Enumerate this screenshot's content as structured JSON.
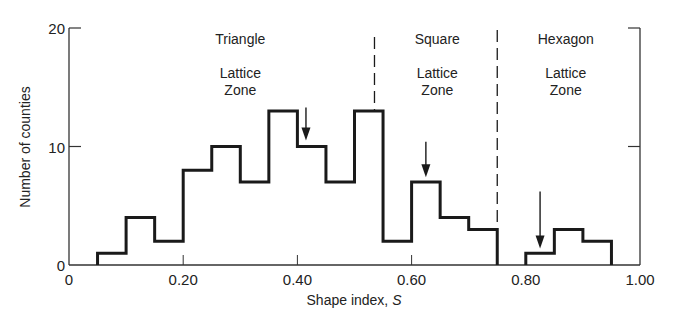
{
  "chart_data": {
    "type": "bar",
    "subtype": "histogram",
    "xlabel": "Shape index, S",
    "ylabel": "Number of counties",
    "xlim": [
      0,
      1.0
    ],
    "ylim": [
      0,
      20
    ],
    "xticks": [
      0,
      0.2,
      0.4,
      0.6,
      0.8,
      1.0
    ],
    "xtick_labels": [
      "0",
      "0.20",
      "0.40",
      "0.60",
      "0.80",
      "1.00"
    ],
    "yticks": [
      0,
      10,
      20
    ],
    "ytick_labels": [
      "0",
      "10",
      "20"
    ],
    "bin_width": 0.05,
    "bins": [
      {
        "x0": 0.05,
        "x1": 0.1,
        "count": 1
      },
      {
        "x0": 0.1,
        "x1": 0.15,
        "count": 4
      },
      {
        "x0": 0.15,
        "x1": 0.2,
        "count": 2
      },
      {
        "x0": 0.2,
        "x1": 0.25,
        "count": 8
      },
      {
        "x0": 0.25,
        "x1": 0.3,
        "count": 10
      },
      {
        "x0": 0.3,
        "x1": 0.35,
        "count": 7
      },
      {
        "x0": 0.35,
        "x1": 0.4,
        "count": 13
      },
      {
        "x0": 0.4,
        "x1": 0.45,
        "count": 10
      },
      {
        "x0": 0.45,
        "x1": 0.5,
        "count": 7
      },
      {
        "x0": 0.5,
        "x1": 0.55,
        "count": 13
      },
      {
        "x0": 0.55,
        "x1": 0.6,
        "count": 2
      },
      {
        "x0": 0.6,
        "x1": 0.65,
        "count": 7
      },
      {
        "x0": 0.65,
        "x1": 0.7,
        "count": 4
      },
      {
        "x0": 0.7,
        "x1": 0.75,
        "count": 3
      },
      {
        "x0": 0.8,
        "x1": 0.85,
        "count": 1
      },
      {
        "x0": 0.85,
        "x1": 0.9,
        "count": 3
      },
      {
        "x0": 0.9,
        "x1": 0.95,
        "count": 2
      }
    ],
    "zone_boundaries": [
      0.535,
      0.75
    ],
    "zones": [
      {
        "name": "Triangle",
        "line2": "Lattice",
        "line3": "Zone",
        "x_center": 0.3
      },
      {
        "name": "Square",
        "line2": "Lattice",
        "line3": "Zone",
        "x_center": 0.645
      },
      {
        "name": "Hexagon",
        "line2": "Lattice",
        "line3": "Zone",
        "x_center": 0.87
      }
    ],
    "mean_arrows": [
      {
        "x": 0.415,
        "y_top": 13.3,
        "y_tip": 10.5
      },
      {
        "x": 0.625,
        "y_top": 10.4,
        "y_tip": 7.4
      },
      {
        "x": 0.825,
        "y_top": 6.2,
        "y_tip": 1.4
      }
    ],
    "grid": false,
    "legend": null,
    "colors": {
      "line": "#1a1a1a",
      "axis": "#333333",
      "background": "#ffffff"
    }
  }
}
